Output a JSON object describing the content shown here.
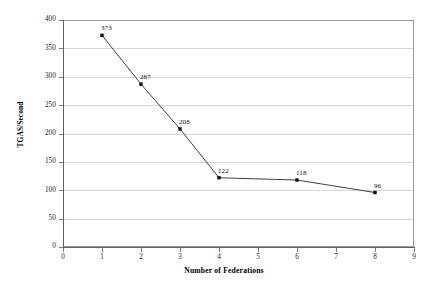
{
  "chart_data": {
    "type": "line",
    "title": "",
    "xlabel": "Number of Federations",
    "ylabel": "TGAS/Second",
    "xlim": [
      0,
      9
    ],
    "ylim": [
      0,
      400
    ],
    "grid": true,
    "legend": "none",
    "marker": "square",
    "line_color": "#404040",
    "marker_color": "#111111",
    "gridline_color": "#d6d6d6",
    "axis_color": "#5f5f5f",
    "x": [
      1,
      2,
      3,
      4,
      6,
      8
    ],
    "values": [
      373,
      287,
      208,
      122,
      118,
      96
    ],
    "point_labels": [
      "373",
      "287",
      "208",
      "122",
      "118",
      "96"
    ],
    "xticks": [
      "0",
      "1",
      "2",
      "3",
      "4",
      "5",
      "6",
      "7",
      "8",
      "9"
    ],
    "yticks": [
      "0",
      "50",
      "100",
      "150",
      "200",
      "250",
      "300",
      "350",
      "400"
    ]
  }
}
